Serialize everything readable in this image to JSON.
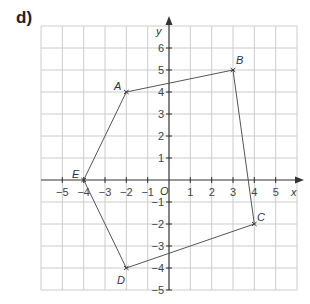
{
  "part_label": "d)",
  "axes": {
    "x_label": "x",
    "y_label": "y",
    "origin_label": "O",
    "x_ticks": [
      "−5",
      "−4",
      "−3",
      "−2",
      "−1",
      "1",
      "2",
      "3",
      "4",
      "5"
    ],
    "y_ticks": [
      "6",
      "5",
      "4",
      "3",
      "2",
      "1",
      "−1",
      "−2",
      "−3",
      "−4",
      "−5"
    ]
  },
  "points": [
    {
      "name": "A",
      "x": -2,
      "y": 4
    },
    {
      "name": "B",
      "x": 3,
      "y": 5
    },
    {
      "name": "C",
      "x": 4,
      "y": -2
    },
    {
      "name": "D",
      "x": -2,
      "y": -4
    },
    {
      "name": "E",
      "x": -4,
      "y": 0
    }
  ],
  "polygon_order": [
    "A",
    "B",
    "C",
    "D",
    "E"
  ],
  "colors": {
    "grid": "#cccccc",
    "axis": "#333333",
    "polygon": "#555555"
  }
}
